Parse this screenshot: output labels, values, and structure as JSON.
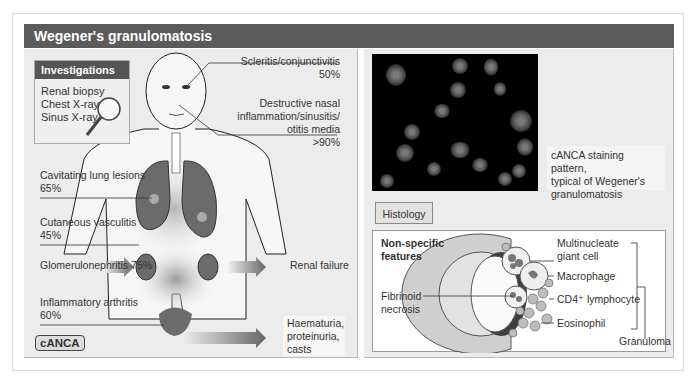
{
  "title": "Wegener's granulomatosis",
  "investigations": {
    "heading": "Investigations",
    "items": [
      "Renal biopsy",
      "Chest X-ray",
      "Sinus X-ray"
    ],
    "icon": "magnifying-glass-icon"
  },
  "body_labels": {
    "scleritis": {
      "name": "Scleritis/conjunctivitis",
      "pct": "50%"
    },
    "nasal": {
      "line1": "Destructive nasal",
      "line2": "inflammation/sinusitis/",
      "line3": "otitis media",
      "pct": ">90%"
    },
    "lung": {
      "name": "Cavitating lung lesions",
      "pct": "65%"
    },
    "skin": {
      "name": "Cutaneous vasculitis",
      "pct": "45%"
    },
    "kidney": {
      "name": "Glomerulonephritis 75%"
    },
    "renal_failure": {
      "name": "Renal failure"
    },
    "arthritis": {
      "name": "Inflammatory arthritis",
      "pct": "60%"
    },
    "urine": {
      "line1": "Haematuria,",
      "line2": "proteinuria,",
      "line3": "casts"
    }
  },
  "canca_badge": "cANCA",
  "micrograph": {
    "caption_line1": "cANCA staining pattern,",
    "caption_line2": "typical of Wegener's",
    "caption_line3": "granulomatosis"
  },
  "histology": {
    "tab_label": "Histology",
    "heading_line1": "Non-specific",
    "heading_line2": "features",
    "fibrinoid_line1": "Fibrinoid",
    "fibrinoid_line2": "necrosis",
    "labels": {
      "multinucleate_line1": "Multinucleate",
      "multinucleate_line2": "giant cell",
      "macrophage": "Macrophage",
      "cd4": "CD4⁺ lymphocyte",
      "eosinophil": "Eosinophil",
      "granuloma": "Granuloma"
    }
  },
  "colors": {
    "title_bar": "#5b5b5b",
    "panel_bg": "#ececec",
    "organ": "#6b6b6b",
    "arrow": "#7a7a7a"
  }
}
